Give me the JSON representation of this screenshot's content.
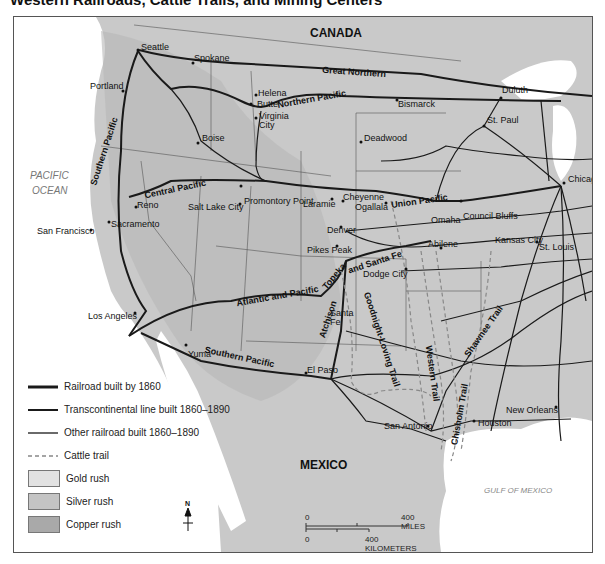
{
  "title": "Western Railroads, Cattle Trails, and Mining Centers",
  "regions": {
    "canada": "CANADA",
    "mexico": "MEXICO",
    "pacific_ocean_line1": "PACIFIC",
    "pacific_ocean_line2": "OCEAN",
    "gulf": "GULF OF MEXICO"
  },
  "railroads": {
    "great_northern": "Great Northern",
    "northern_pacific": "Northern Pacific",
    "southern_pacific_west": "Southern Pacific",
    "central_pacific": "Central Pacific",
    "union_pacific": "Union Pacific",
    "atlantic_pacific": "Atlantic and Pacific",
    "atchison": "Atchison",
    "topeka": "Topeka",
    "santa_fe": "and Santa Fe",
    "southern_pacific_south": "Southern Pacific"
  },
  "trails": {
    "goodnight_loving": "Goodnight-Loving Trail",
    "western": "Western Trail",
    "chisholm": "Chisholm Trail",
    "shawnee": "Shawnee Trail"
  },
  "cities": {
    "seattle": "Seattle",
    "spokane": "Spokane",
    "portland": "Portland",
    "helena": "Helena",
    "butte": "Butte",
    "virginia_city": "Virginia City",
    "boise": "Boise",
    "bismarck": "Bismarck",
    "duluth": "Duluth",
    "st_paul": "St. Paul",
    "deadwood": "Deadwood",
    "chicago": "Chicago",
    "promontory_point": "Promontory Point",
    "salt_lake_city": "Salt Lake City",
    "reno": "Reno",
    "sacramento": "Sacramento",
    "san_francisco": "San Francisco",
    "laramie": "Laramie",
    "cheyenne": "Cheyenne",
    "ogallala": "Ogallala",
    "omaha": "Omaha",
    "council_bluffs": "Council Bluffs",
    "denver": "Denver",
    "pikes_peak": "Pikes Peak",
    "abilene": "Abilene",
    "kansas_city": "Kansas City",
    "st_louis": "St. Louis",
    "dodge_city": "Dodge City",
    "los_angeles": "Los Angeles",
    "santa_fe_city": "Santa Fe",
    "yuma": "Yuma",
    "el_paso": "El Paso",
    "san_antonio": "San Antonio",
    "houston": "Houston",
    "new_orleans": "New Orleans"
  },
  "legend": {
    "items": [
      {
        "label": "Railroad built by 1860",
        "type": "line",
        "width": 3
      },
      {
        "label": "Transcontinental line built 1860–1890",
        "type": "line",
        "width": 2
      },
      {
        "label": "Other railroad built 1860–1890",
        "type": "line",
        "width": 1.3
      },
      {
        "label": "Cattle trail",
        "type": "dashed"
      },
      {
        "label": "Gold rush",
        "type": "swatch",
        "color": "#e2e2e2"
      },
      {
        "label": "Silver rush",
        "type": "swatch",
        "color": "#c4c4c4"
      },
      {
        "label": "Copper rush",
        "type": "swatch",
        "color": "#a9a9a9"
      }
    ]
  },
  "compass": {
    "north_label": "N"
  },
  "scale": {
    "miles_zero": "0",
    "miles_label": "400 MILES",
    "km_zero": "0",
    "km_label": "400 KILOMETERS"
  },
  "colors": {
    "land": "#c9c9c9",
    "water": "#ffffff",
    "rail": "#1a1a1a",
    "trail": "#8a8a8a"
  }
}
